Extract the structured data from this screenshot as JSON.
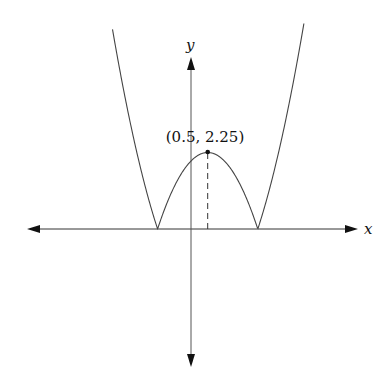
{
  "chart_data": {
    "type": "line",
    "title": "",
    "function": "y = |x^2 - x - 2|",
    "xlabel": "x",
    "ylabel": "y",
    "xlim": [
      -4.9,
      5.0
    ],
    "ylim": [
      -4.1,
      5.1
    ],
    "grid": false,
    "legend": null,
    "annotations": [
      {
        "text": "(0.5, 2.25)",
        "x": 0.5,
        "y": 2.25,
        "type": "point-with-dashed-drop-line"
      }
    ],
    "key_points": [
      {
        "x": -1,
        "y": 0,
        "label": "root"
      },
      {
        "x": 2,
        "y": 0,
        "label": "root"
      },
      {
        "x": 0.5,
        "y": 2.25,
        "label": "local maximum"
      }
    ],
    "series": [
      {
        "name": "|x^2 - x - 2|",
        "x": [
          -2.4,
          -2,
          -1.5,
          -1,
          -0.5,
          0,
          0.5,
          1,
          1.5,
          2,
          2.5,
          3,
          3.4
        ],
        "values": [
          6.16,
          4,
          1.75,
          0,
          1.25,
          2,
          2.25,
          2,
          1.25,
          0,
          1.75,
          4,
          6.16
        ]
      }
    ]
  },
  "labels": {
    "x_axis": "x",
    "y_axis": "y",
    "peak": "(0.5, 2.25)"
  },
  "colors": {
    "axis": "#111111",
    "curve": "#444444",
    "background": "#ffffff"
  }
}
